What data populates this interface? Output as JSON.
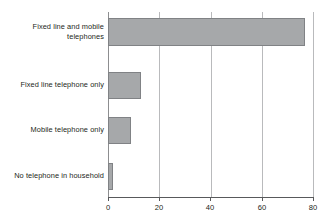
{
  "chart_data": {
    "type": "bar",
    "orientation": "horizontal",
    "title": "",
    "xlabel": "",
    "ylabel": "",
    "xlim": [
      0,
      80
    ],
    "xticks": [
      0,
      20,
      40,
      60,
      80
    ],
    "xtick_labels": [
      "0",
      "20",
      "40",
      "60",
      "80"
    ],
    "grid": true,
    "grid_axis": "x",
    "legend": false,
    "categories": [
      "Fixed line and mobile telephones",
      "Fixed line telephone only",
      "Mobile telephone only",
      "No telephone in household"
    ],
    "category_labels_display": [
      "Fixed line and mobile\ntelephones",
      "Fixed line telephone only",
      "Mobile telephone only",
      "No telephone in household"
    ],
    "values": [
      77,
      13,
      9,
      2
    ],
    "bar_color": "#a6a8aa",
    "bar_border_color": "#808285",
    "gridline_color": "#b9babc",
    "axis_color": "#58595b",
    "text_color": "#231f20"
  }
}
